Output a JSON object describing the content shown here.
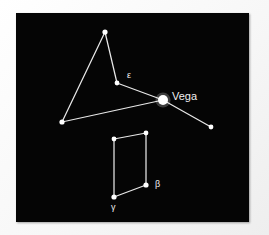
{
  "figure": {
    "kind": "star-chart",
    "constellation": "Lyra",
    "plate_background": "#050505",
    "page_background": "#fdfdfd",
    "star_color": "#ffffff",
    "line_color": "#e8e8e8",
    "label_color": "#f0f0f0"
  },
  "chart_data": {
    "type": "scatter",
    "title": "",
    "xlabel": "",
    "ylabel": "",
    "xlim": [
      16,
      249
    ],
    "ylim": [
      13,
      222
    ],
    "grid": false,
    "legend": "none",
    "stars": [
      {
        "id": "apex",
        "label": "",
        "x": 105,
        "y": 32,
        "r": 2.6,
        "magnitude_rank": 2
      },
      {
        "id": "epsilon",
        "label": "ε",
        "x": 117,
        "y": 83,
        "r": 2.4,
        "magnitude_rank": 3,
        "label_x": 127,
        "label_y": 78
      },
      {
        "id": "vega",
        "label": "Vega",
        "x": 163,
        "y": 100,
        "r": 5.0,
        "magnitude_rank": 1,
        "label_x": 172,
        "label_y": 100
      },
      {
        "id": "left-vertex",
        "label": "",
        "x": 62,
        "y": 122,
        "r": 2.6,
        "magnitude_rank": 2
      },
      {
        "id": "east-star",
        "label": "",
        "x": 211,
        "y": 127,
        "r": 2.4,
        "magnitude_rank": 3
      },
      {
        "id": "quad-top-right",
        "label": "",
        "x": 146,
        "y": 133,
        "r": 2.4,
        "magnitude_rank": 3
      },
      {
        "id": "quad-top-left",
        "label": "",
        "x": 114,
        "y": 139,
        "r": 2.4,
        "magnitude_rank": 3
      },
      {
        "id": "beta",
        "label": "β",
        "x": 146,
        "y": 185,
        "r": 2.6,
        "magnitude_rank": 2,
        "label_x": 155,
        "label_y": 187
      },
      {
        "id": "gamma",
        "label": "γ",
        "x": 114,
        "y": 197,
        "r": 2.6,
        "magnitude_rank": 2,
        "label_x": 111,
        "label_y": 210
      }
    ],
    "lines": [
      {
        "from": "apex",
        "to": "epsilon"
      },
      {
        "from": "apex",
        "to": "left-vertex"
      },
      {
        "from": "epsilon",
        "to": "vega"
      },
      {
        "from": "left-vertex",
        "to": "vega"
      },
      {
        "from": "vega",
        "to": "east-star"
      },
      {
        "from": "quad-top-left",
        "to": "quad-top-right"
      },
      {
        "from": "quad-top-right",
        "to": "beta"
      },
      {
        "from": "beta",
        "to": "gamma"
      },
      {
        "from": "gamma",
        "to": "quad-top-left"
      }
    ],
    "annotations": [
      {
        "text": "Vega",
        "x": 172,
        "y": 100
      },
      {
        "text": "ε",
        "x": 127,
        "y": 78
      },
      {
        "text": "β",
        "x": 155,
        "y": 187
      },
      {
        "text": "γ",
        "x": 111,
        "y": 210
      }
    ]
  }
}
